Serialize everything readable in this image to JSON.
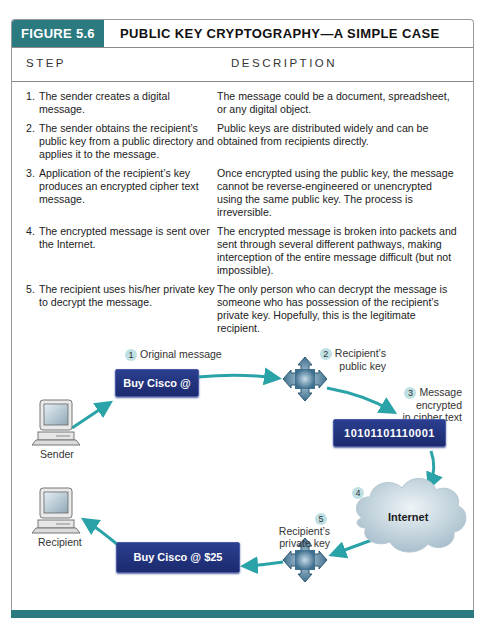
{
  "header": {
    "figure_label": "FIGURE 5.6",
    "title": "PUBLIC KEY CRYPTOGRAPHY—A SIMPLE CASE"
  },
  "table": {
    "columns": [
      "STEP",
      "DESCRIPTION"
    ],
    "rows": [
      {
        "num": "1.",
        "step": "The sender creates a digital message.",
        "description": "The message could be a document, spreadsheet, or any digital object."
      },
      {
        "num": "2.",
        "step": "The sender obtains the recipient’s public key from a public directory and applies it to the message.",
        "description": "Public keys are distributed widely and can be obtained from recipients directly."
      },
      {
        "num": "3.",
        "step": "Application of the recipient’s key produces an encrypted cipher text message.",
        "description": "Once encrypted using the public key, the message cannot be reverse-engineered or unencrypted using the same public key. The process is irreversible."
      },
      {
        "num": "4.",
        "step": "The encrypted message is sent over the Internet.",
        "description": "The encrypted message is broken into packets and sent through several different pathways, making interception of the entire message difficult (but not impossible)."
      },
      {
        "num": "5.",
        "step": "The recipient uses his/her private key to decrypt the message.",
        "description": "The only person who can decrypt the message is someone who has possession of the recipient’s private key. Hopefully, this is the legitimate recipient."
      }
    ]
  },
  "diagram": {
    "nodes": {
      "sender": {
        "label": "Sender",
        "icon": "computer-icon"
      },
      "recipient": {
        "label": "Recipient",
        "icon": "computer-icon"
      },
      "original_message": {
        "text": "Buy Cisco @ $25"
      },
      "cipher_message": {
        "text": "10101101110001"
      },
      "decrypted_message": {
        "text": "Buy Cisco @ $25"
      },
      "internet": {
        "text": "Internet",
        "icon": "cloud-icon"
      },
      "public_key": {
        "icon": "key-diamond-icon"
      },
      "private_key": {
        "icon": "key-diamond-icon"
      }
    },
    "steps": [
      {
        "num": "1",
        "label": "Original message"
      },
      {
        "num": "2",
        "label_line1": "Recipient’s",
        "label_line2": "public key"
      },
      {
        "num": "3",
        "label_line1": "Message encrypted",
        "label_line2": "in cipher text"
      },
      {
        "num": "4",
        "label": ""
      },
      {
        "num": "5",
        "label_line1": "Recipient’s",
        "label_line2": "private key"
      }
    ],
    "colors": {
      "teal": "#2b7a80",
      "arrow": "#2aa3a8",
      "message_box": "#1f2f78",
      "key": "#4a7a98",
      "cloud": "#c9d9e2"
    }
  }
}
